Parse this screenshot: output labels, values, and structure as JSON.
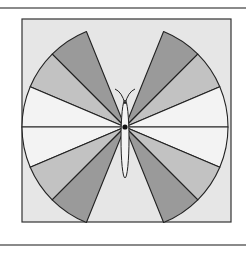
{
  "figure": {
    "frame": {
      "x": 22,
      "y": 19,
      "w": 209,
      "h": 203,
      "fill": "#e6e6e6",
      "stroke": "#333333"
    },
    "center": {
      "x": 125,
      "y": 127
    },
    "radius": 103,
    "colors": {
      "dark": "#9a9a9a",
      "medium": "#c2c2c2",
      "light": "#f3f3f3",
      "stroke": "#222222"
    },
    "wings": [
      {
        "side": "left",
        "shade": "dark",
        "from_deg": 112,
        "to_deg": 135
      },
      {
        "side": "left",
        "shade": "medium",
        "from_deg": 135,
        "to_deg": 157
      },
      {
        "side": "left",
        "shade": "light",
        "from_deg": 157,
        "to_deg": 180
      },
      {
        "side": "left",
        "shade": "light",
        "from_deg": 180,
        "to_deg": 203
      },
      {
        "side": "left",
        "shade": "medium",
        "from_deg": 203,
        "to_deg": 225
      },
      {
        "side": "left",
        "shade": "dark",
        "from_deg": 225,
        "to_deg": 248
      },
      {
        "side": "right",
        "shade": "dark",
        "from_deg": 45,
        "to_deg": 68
      },
      {
        "side": "right",
        "shade": "medium",
        "from_deg": 23,
        "to_deg": 45
      },
      {
        "side": "right",
        "shade": "light",
        "from_deg": 0,
        "to_deg": 23
      },
      {
        "side": "right",
        "shade": "light",
        "from_deg": -23,
        "to_deg": 0
      },
      {
        "side": "right",
        "shade": "medium",
        "from_deg": -45,
        "to_deg": -23
      },
      {
        "side": "right",
        "shade": "dark",
        "from_deg": -68,
        "to_deg": -45
      }
    ],
    "body": {
      "cx": 125,
      "cy": 139,
      "rx": 4,
      "ry": 39
    },
    "antennae": [
      {
        "d": "M125,104 Q122,92 115,89"
      },
      {
        "d": "M125,104 Q128,92 135,89"
      }
    ]
  }
}
